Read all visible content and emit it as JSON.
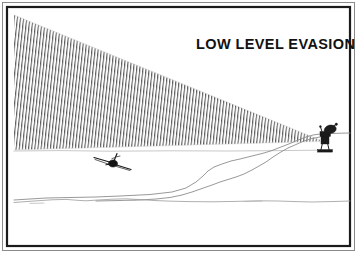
{
  "figure": {
    "title": "LOW LEVEL EVASION",
    "frame": {
      "border_color": "#1b1b1b",
      "outer_color": "#8a8a8a",
      "background": "#ffffff"
    },
    "scene": {
      "radar_beam": {
        "label": "radar beam",
        "fill_style": "diagonal hatch",
        "hatch_color": "#2a2a2a",
        "apex_x": 320,
        "apex_y": 140,
        "top_left_x": 14,
        "top_left_y": 15,
        "bottom_left_x": 14,
        "bottom_left_y": 150
      },
      "radar_station": {
        "label": "radar antenna",
        "color": "#1a1a1a",
        "x": 318,
        "y": 128
      },
      "aircraft": {
        "label": "low-flying aircraft",
        "color": "#141414",
        "x": 113,
        "y": 163
      },
      "terrain": {
        "label": "terrain profile",
        "ground_color": "#9a9a9a",
        "ridge_color": "#8d8d8d"
      }
    }
  }
}
